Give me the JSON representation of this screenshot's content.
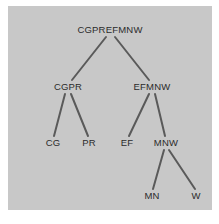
{
  "figure": {
    "background_color": "#ffffff",
    "panel_color": "#c8c8c8",
    "label_color": "#2b2b2b",
    "edge_color": "#5a5a5a"
  },
  "chart_data": {
    "type": "diagram",
    "diagram_type": "tree",
    "title": "",
    "orientation": "top-down",
    "grid": false,
    "legend": null,
    "nodes": [
      {
        "id": "root",
        "label": "CGPREFMNW",
        "x": 110,
        "y": 30,
        "level": 0,
        "parent": null
      },
      {
        "id": "cgpr",
        "label": "CGPR",
        "x": 68,
        "y": 87,
        "level": 1,
        "parent": "root"
      },
      {
        "id": "efmnw",
        "label": "EFMNW",
        "x": 152,
        "y": 87,
        "level": 1,
        "parent": "root"
      },
      {
        "id": "cg",
        "label": "CG",
        "x": 53,
        "y": 143,
        "level": 2,
        "parent": "cgpr"
      },
      {
        "id": "pr",
        "label": "PR",
        "x": 89,
        "y": 143,
        "level": 2,
        "parent": "cgpr"
      },
      {
        "id": "ef",
        "label": "EF",
        "x": 127,
        "y": 143,
        "level": 2,
        "parent": "efmnw"
      },
      {
        "id": "mnw",
        "label": "MNW",
        "x": 166,
        "y": 143,
        "level": 2,
        "parent": "efmnw"
      },
      {
        "id": "mn",
        "label": "MN",
        "x": 152,
        "y": 196,
        "level": 3,
        "parent": "mnw"
      },
      {
        "id": "w",
        "label": "W",
        "x": 196,
        "y": 196,
        "level": 3,
        "parent": "mnw"
      }
    ],
    "edges": [
      {
        "from": "root",
        "to": "cgpr",
        "x1": 106,
        "y1": 37,
        "x2": 72,
        "y2": 80
      },
      {
        "from": "root",
        "to": "efmnw",
        "x1": 115,
        "y1": 37,
        "x2": 149,
        "y2": 80
      },
      {
        "from": "cgpr",
        "to": "cg",
        "x1": 65,
        "y1": 94,
        "x2": 54,
        "y2": 136
      },
      {
        "from": "cgpr",
        "to": "pr",
        "x1": 71,
        "y1": 94,
        "x2": 88,
        "y2": 136
      },
      {
        "from": "efmnw",
        "to": "ef",
        "x1": 149,
        "y1": 94,
        "x2": 129,
        "y2": 136
      },
      {
        "from": "efmnw",
        "to": "mnw",
        "x1": 155,
        "y1": 94,
        "x2": 165,
        "y2": 136
      },
      {
        "from": "mnw",
        "to": "mn",
        "x1": 164,
        "y1": 150,
        "x2": 153,
        "y2": 189
      },
      {
        "from": "mnw",
        "to": "w",
        "x1": 169,
        "y1": 150,
        "x2": 195,
        "y2": 189
      }
    ]
  }
}
